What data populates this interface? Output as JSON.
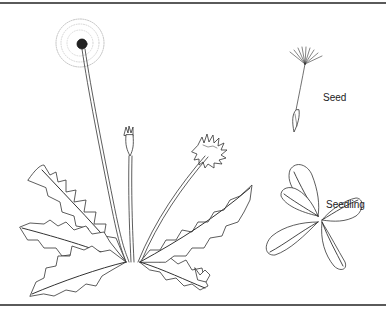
{
  "figure": {
    "labels": {
      "seed": "Seed",
      "seedling": "Seedling"
    },
    "parts": [
      "seed-head",
      "flower-head",
      "flower-bud",
      "leaf-rosette",
      "seed",
      "seedling"
    ],
    "colors": {
      "line": "#333333",
      "rule": "#5a5a5a",
      "background": "#ffffff"
    }
  }
}
